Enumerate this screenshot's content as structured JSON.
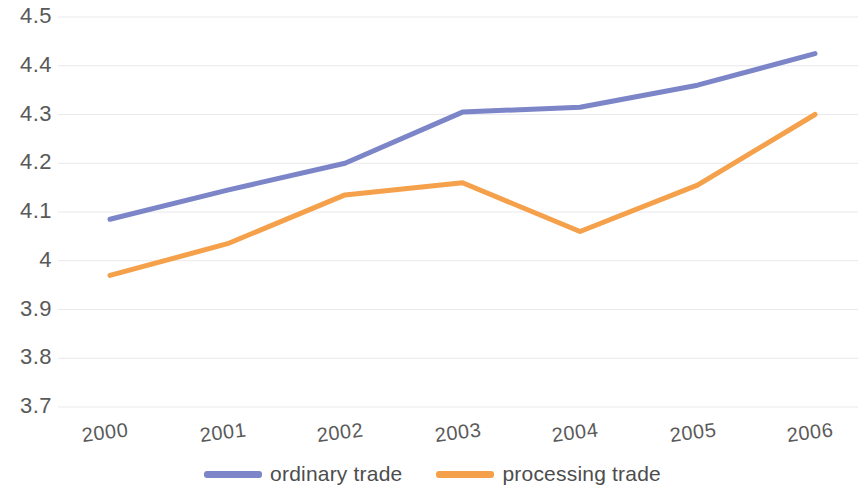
{
  "chart_data": {
    "type": "line",
    "title": "",
    "subtitle": "",
    "xlabel": "",
    "ylabel": "",
    "categories": [
      "2000",
      "2001",
      "2002",
      "2003",
      "2004",
      "2005",
      "2006"
    ],
    "series": [
      {
        "name": "ordinary trade",
        "color": "#7b85c7",
        "values": [
          4.085,
          4.145,
          4.2,
          4.305,
          4.315,
          4.36,
          4.425
        ]
      },
      {
        "name": "processing trade",
        "color": "#f5a04a",
        "values": [
          3.97,
          4.035,
          4.135,
          4.16,
          4.06,
          4.155,
          4.3
        ]
      }
    ],
    "ylim": [
      3.7,
      4.5
    ],
    "yticks": [
      4.5,
      4.4,
      4.3,
      4.2,
      4.1,
      4.0,
      3.9,
      3.8,
      3.7
    ],
    "ytick_labels": [
      "4.5",
      "4.4",
      "4.3",
      "4.2",
      "4.1",
      "4",
      "3.9",
      "3.8",
      "3.7"
    ],
    "grid": true,
    "grid_color": "#e9e9ee",
    "legend_position": "bottom",
    "line_width": 5
  },
  "axis": {
    "y_labels": [
      "4.5",
      "4.4",
      "4.3",
      "4.2",
      "4.1",
      "4",
      "3.9",
      "3.8",
      "3.7"
    ],
    "x_labels": [
      "2000",
      "2001",
      "2002",
      "2003",
      "2004",
      "2005",
      "2006"
    ]
  },
  "legend": {
    "entries": [
      {
        "label": "ordinary trade",
        "color": "#7b85c7"
      },
      {
        "label": "processing trade",
        "color": "#f5a04a"
      }
    ]
  }
}
